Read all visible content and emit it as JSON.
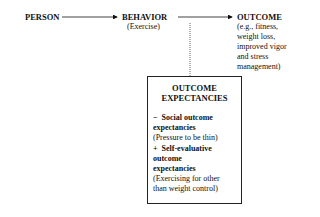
{
  "nodes": {
    "person": {
      "label": "PERSON"
    },
    "behavior": {
      "label": "BEHAVIOR",
      "detail": "(Exercise)"
    },
    "outcome": {
      "label": "OUTCOME",
      "detail_lines": [
        "(e.g., fitness,",
        "weight loss,",
        "improved vigor",
        "and stress",
        "management)"
      ]
    }
  },
  "expectancies_box": {
    "title_lines": [
      "OUTCOME",
      "EXPECTANCIES"
    ],
    "items": [
      {
        "sign": "−",
        "heading_lines": [
          "Social outcome",
          "expectancies"
        ],
        "detail": "(Pressure to be thin)"
      },
      {
        "sign": "+",
        "heading_lines": [
          "Self-evaluative",
          "outcome",
          "expectancies"
        ],
        "detail_lines": [
          "(Exercising for other",
          "than weight control)"
        ]
      }
    ]
  },
  "edges": [
    {
      "from": "person",
      "to": "behavior",
      "style": "solid-arrow"
    },
    {
      "from": "behavior",
      "to": "outcome",
      "style": "solid-arrow"
    },
    {
      "from": "expectancies_box",
      "to": "behavior-outcome-link",
      "style": "dotted"
    }
  ]
}
